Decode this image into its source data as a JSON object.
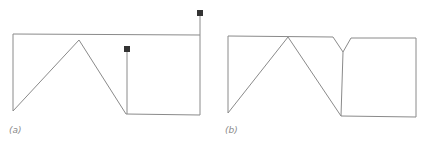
{
  "figure": {
    "panels": [
      {
        "id": "a",
        "label": "(a)",
        "description": "Open polyline frame with triangular zigzag and two terminal square nodes",
        "polylines": [
          [
            [
              13,
              34
            ],
            [
              200,
              35
            ]
          ],
          [
            [
              13,
              34
            ],
            [
              13,
              111
            ]
          ],
          [
            [
              13,
              111
            ],
            [
              79,
              40
            ],
            [
              126,
              114
            ],
            [
              200,
              115
            ],
            [
              200,
              13
            ]
          ],
          [
            [
              127,
              114
            ],
            [
              127,
              49
            ]
          ]
        ],
        "nodes": [
          [
            200,
            13
          ],
          [
            127,
            49
          ]
        ]
      },
      {
        "id": "b",
        "label": "(b)",
        "description": "Closed polyline frame with triangular zigzag and V-notch joined at top",
        "polylines": [
          [
            [
              228,
              36
            ],
            [
              228,
              113
            ],
            [
              288,
              37
            ],
            [
              341,
              116
            ],
            [
              416,
              117
            ],
            [
              416,
              38
            ],
            [
              351,
              38
            ],
            [
              343,
              52
            ],
            [
              333,
              37
            ],
            [
              228,
              36
            ]
          ],
          [
            [
              343,
              52
            ],
            [
              341,
              116
            ]
          ]
        ],
        "nodes": []
      }
    ],
    "colors": {
      "line": "#8a8a8a",
      "node": "#333333",
      "background": "#ffffff"
    }
  }
}
